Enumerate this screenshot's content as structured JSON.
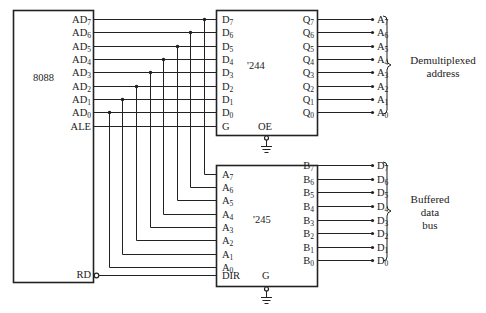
{
  "cpu": {
    "name": "8088",
    "pins": [
      {
        "base": "AD",
        "sub": "7"
      },
      {
        "base": "AD",
        "sub": "6"
      },
      {
        "base": "AD",
        "sub": "5"
      },
      {
        "base": "AD",
        "sub": "4"
      },
      {
        "base": "AD",
        "sub": "3"
      },
      {
        "base": "AD",
        "sub": "2"
      },
      {
        "base": "AD",
        "sub": "1"
      },
      {
        "base": "AD",
        "sub": "0"
      },
      {
        "base": "ALE",
        "sub": ""
      }
    ],
    "rd_pin": "RD"
  },
  "latch": {
    "name": "'244",
    "inputs": [
      {
        "base": "D",
        "sub": "7"
      },
      {
        "base": "D",
        "sub": "6"
      },
      {
        "base": "D",
        "sub": "5"
      },
      {
        "base": "D",
        "sub": "4"
      },
      {
        "base": "D",
        "sub": "3"
      },
      {
        "base": "D",
        "sub": "2"
      },
      {
        "base": "D",
        "sub": "1"
      },
      {
        "base": "D",
        "sub": "0"
      },
      {
        "base": "G",
        "sub": ""
      }
    ],
    "outputs": [
      {
        "base": "Q",
        "sub": "7"
      },
      {
        "base": "Q",
        "sub": "6"
      },
      {
        "base": "Q",
        "sub": "5"
      },
      {
        "base": "Q",
        "sub": "4"
      },
      {
        "base": "Q",
        "sub": "3"
      },
      {
        "base": "Q",
        "sub": "2"
      },
      {
        "base": "Q",
        "sub": "1"
      },
      {
        "base": "Q",
        "sub": "0"
      }
    ],
    "enable_pin": "OE"
  },
  "transceiver": {
    "name": "'245",
    "inputs": [
      {
        "base": "A",
        "sub": "7"
      },
      {
        "base": "A",
        "sub": "6"
      },
      {
        "base": "A",
        "sub": "5"
      },
      {
        "base": "A",
        "sub": "4"
      },
      {
        "base": "A",
        "sub": "3"
      },
      {
        "base": "A",
        "sub": "2"
      },
      {
        "base": "A",
        "sub": "1"
      },
      {
        "base": "A",
        "sub": "0"
      },
      {
        "base": "DIR",
        "sub": ""
      }
    ],
    "outputs": [
      {
        "base": "B",
        "sub": "7"
      },
      {
        "base": "B",
        "sub": "6"
      },
      {
        "base": "B",
        "sub": "5"
      },
      {
        "base": "B",
        "sub": "4"
      },
      {
        "base": "B",
        "sub": "3"
      },
      {
        "base": "B",
        "sub": "2"
      },
      {
        "base": "B",
        "sub": "1"
      },
      {
        "base": "B",
        "sub": "0"
      }
    ],
    "enable_pin": "G"
  },
  "address_bus": {
    "signals": [
      {
        "base": "A",
        "sub": "7"
      },
      {
        "base": "A",
        "sub": "6"
      },
      {
        "base": "A",
        "sub": "5"
      },
      {
        "base": "A",
        "sub": "4"
      },
      {
        "base": "A",
        "sub": "3"
      },
      {
        "base": "A",
        "sub": "2"
      },
      {
        "base": "A",
        "sub": "1"
      },
      {
        "base": "A",
        "sub": "0"
      }
    ],
    "label_line1": "Demultiplexed",
    "label_line2": "address"
  },
  "data_bus": {
    "signals": [
      {
        "base": "D",
        "sub": "7"
      },
      {
        "base": "D",
        "sub": "6"
      },
      {
        "base": "D",
        "sub": "5"
      },
      {
        "base": "D",
        "sub": "4"
      },
      {
        "base": "D",
        "sub": "3"
      },
      {
        "base": "D",
        "sub": "2"
      },
      {
        "base": "D",
        "sub": "1"
      },
      {
        "base": "D",
        "sub": "0"
      }
    ],
    "label_line1": "Buffered",
    "label_line2": "data",
    "label_line3": "bus"
  },
  "colors": {
    "line": "#222222",
    "background": "#ffffff"
  }
}
